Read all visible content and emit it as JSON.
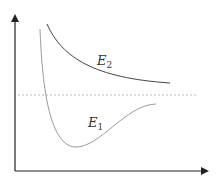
{
  "diagram": {
    "title": "",
    "curves": [
      {
        "id": "E2",
        "label_main": "E",
        "label_sub": "2",
        "color": "#444444",
        "style": "solid"
      },
      {
        "id": "E1",
        "label_main": "E",
        "label_sub": "1",
        "color": "#9a9a9a",
        "style": "solid"
      }
    ],
    "reference_line": {
      "style": "dashed",
      "color": "#aaaaaa"
    },
    "axes": {
      "x_label": "",
      "y_label": "",
      "color": "#222222"
    }
  }
}
